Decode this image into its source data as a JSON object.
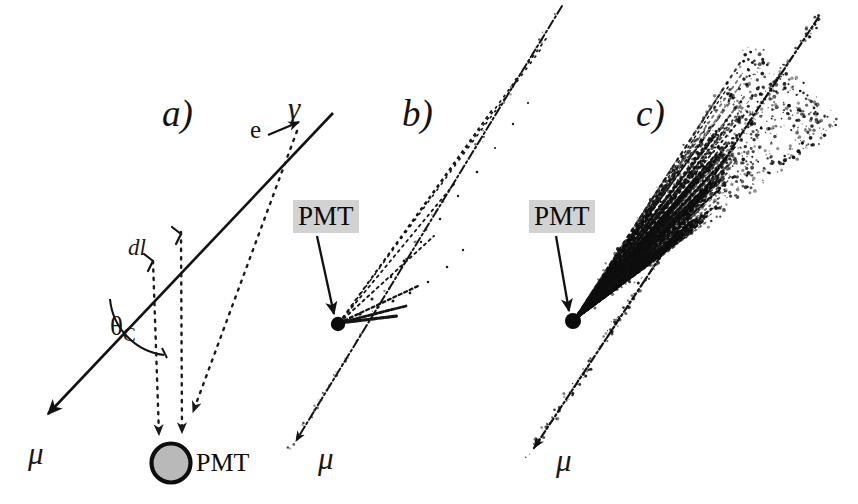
{
  "figure": {
    "width": 858,
    "height": 504,
    "background": "#ffffff",
    "ink": "#111111"
  },
  "panels": [
    {
      "id": "a",
      "label": "a)",
      "label_pos": {
        "x": 162,
        "y": 95
      },
      "muon": {
        "symbol": "μ",
        "symbol_pos": {
          "x": 28,
          "y": 438
        },
        "track_start": {
          "x": 333,
          "y": 113
        },
        "track_end": {
          "x": 42,
          "y": 421
        },
        "arrow": true
      },
      "gamma": {
        "symbol": "γ",
        "pos": {
          "x": 288,
          "y": 93
        }
      },
      "electron": {
        "symbol": "e",
        "pos": {
          "x": 250,
          "y": 117
        }
      },
      "segment": {
        "symbol": "dl",
        "pos": {
          "x": 128,
          "y": 236
        }
      },
      "cherenkov_angle": {
        "symbol": "θ",
        "subscript": "C",
        "pos": {
          "x": 110,
          "y": 313
        }
      },
      "pmt": {
        "label": "PMT",
        "label_pos": {
          "x": 192,
          "y": 448
        },
        "center": {
          "x": 171,
          "y": 463
        },
        "radius": 20,
        "fill": "#b9b9b9",
        "stroke": "#0d0d0d"
      },
      "photon_paths": [
        {
          "from": {
            "x": 153,
            "y": 261
          },
          "to": {
            "x": 159,
            "y": 440
          }
        },
        {
          "from": {
            "x": 181,
            "y": 231
          },
          "to": {
            "x": 182,
            "y": 438
          }
        },
        {
          "from": {
            "x": 297,
            "y": 131
          },
          "to": {
            "x": 191,
            "y": 418
          }
        }
      ]
    },
    {
      "id": "b",
      "label": "b)",
      "label_pos": {
        "x": 402,
        "y": 95
      },
      "muon": {
        "symbol": "μ",
        "symbol_pos": {
          "x": 318,
          "y": 443
        },
        "track_start": {
          "x": 562,
          "y": 6
        },
        "track_end": {
          "x": 290,
          "y": 450
        },
        "arrow": true
      },
      "pmt": {
        "label": "PMT",
        "label_pos": {
          "x": 293,
          "y": 200
        },
        "dot": {
          "x": 337,
          "y": 325
        },
        "dot_radius": 7,
        "arrow_from": {
          "x": 319,
          "y": 238
        },
        "arrow_to": {
          "x": 336,
          "y": 318
        }
      },
      "photon_count": 6,
      "cone_apex": {
        "x": 339,
        "y": 323
      }
    },
    {
      "id": "c",
      "label": "c)",
      "label_pos": {
        "x": 636,
        "y": 95
      },
      "muon": {
        "symbol": "μ",
        "symbol_pos": {
          "x": 556,
          "y": 445
        },
        "track_start": {
          "x": 818,
          "y": 18
        },
        "track_end": {
          "x": 528,
          "y": 456
        },
        "arrow": true
      },
      "pmt": {
        "label": "PMT",
        "label_pos": {
          "x": 529,
          "y": 200
        },
        "dot": {
          "x": 572,
          "y": 322
        },
        "dot_radius": 8,
        "arrow_from": {
          "x": 558,
          "y": 238
        },
        "arrow_to": {
          "x": 570,
          "y": 315
        }
      },
      "photon_count": 260,
      "cone_apex": {
        "x": 574,
        "y": 320
      }
    }
  ],
  "legend_text": {
    "pmt": "PMT",
    "muon": "μ",
    "gamma": "γ",
    "electron": "e",
    "segment": "dl",
    "cherenkov": "θC"
  }
}
